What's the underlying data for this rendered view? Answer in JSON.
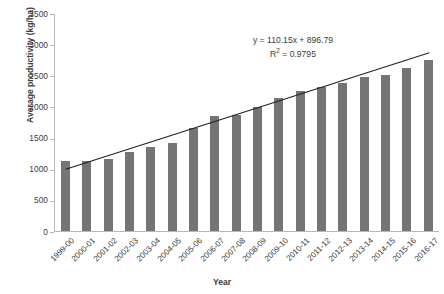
{
  "chart_data": {
    "type": "bar",
    "title": "",
    "xlabel": "Year",
    "ylabel": "Average productivity (kg/ha)",
    "categories": [
      "1999-00",
      "2000-01",
      "2001-02",
      "2002-03",
      "2003-04",
      "2004-05",
      "2005-06",
      "2006-07",
      "2007-08",
      "2008-09",
      "2009-10",
      "2010-11",
      "2011-12",
      "2012-13",
      "2013-14",
      "2014-15",
      "2015-16",
      "2016-17"
    ],
    "values": [
      1120,
      1120,
      1150,
      1275,
      1345,
      1410,
      1650,
      1840,
      1860,
      1990,
      2130,
      2240,
      2310,
      2370,
      2480,
      2500,
      2620,
      2750
    ],
    "series": [
      {
        "name": "Average productivity",
        "values": [
          1120,
          1120,
          1150,
          1275,
          1345,
          1410,
          1650,
          1840,
          1860,
          1990,
          2130,
          2240,
          2310,
          2370,
          2480,
          2500,
          2620,
          2750
        ]
      }
    ],
    "ylim": [
      0,
      3500
    ],
    "yticks": [
      0,
      500,
      1000,
      1500,
      2000,
      2500,
      3000,
      3500
    ],
    "ytick_labels": [
      "0",
      "500",
      "1000",
      "1500",
      "2000",
      "2500",
      "3000",
      "3500"
    ],
    "grid": false,
    "legend": false,
    "bar_color": "#757575",
    "trendline": {
      "type": "linear",
      "equation": "y = 110.15x + 896.79",
      "r2_text": "R² = 0.9795",
      "slope": 110.15,
      "intercept": 896.79,
      "r2": 0.9795,
      "color": "#222222",
      "start_value": 1006.94,
      "end_value": 2879.49
    }
  },
  "annotations": {
    "equation_line1": "y = 110.15x + 896.79",
    "equation_line2_prefix": "R",
    "equation_line2_sup": "2",
    "equation_line2_suffix": " = 0.9795"
  },
  "axes": {
    "y_title": "Average productivity (kg/ha)",
    "x_title": "Year"
  }
}
